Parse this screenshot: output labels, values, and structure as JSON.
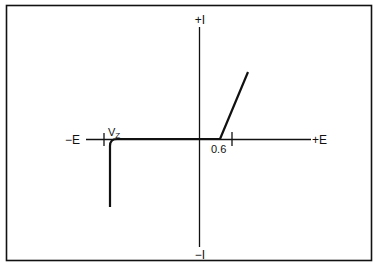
{
  "diagram": {
    "colors": {
      "line": "#111111",
      "background": "#ffffff"
    },
    "axes": {
      "vertical_top_label": "+I",
      "vertical_bottom_label": "−I",
      "horizontal_left_label": "−E",
      "horizontal_right_label": "+E"
    },
    "markers": {
      "zener_voltage_label": "V",
      "zener_voltage_subscript": "Z",
      "forward_voltage_label": "0.6"
    },
    "curves": [
      {
        "name": "forward-conduction",
        "description": "rises steeply after 0.6 V"
      },
      {
        "name": "zener-breakdown",
        "description": "sharp drop in negative current at Vz"
      }
    ]
  }
}
